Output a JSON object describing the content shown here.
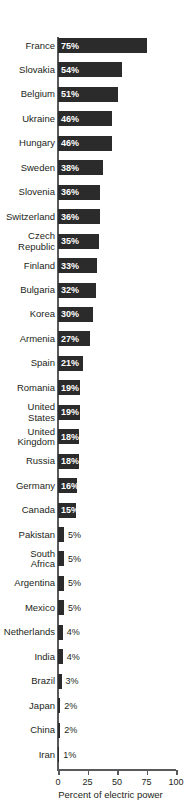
{
  "chart_data": {
    "type": "bar",
    "orientation": "horizontal",
    "title": "",
    "subtitle": "",
    "xlabel": "Percent of electric power",
    "ylabel": "",
    "xlim": [
      0,
      100
    ],
    "xticks": [
      0,
      25,
      50,
      75,
      100
    ],
    "xtick_labels": [
      "0",
      "25",
      "50",
      "75",
      "100"
    ],
    "grid": false,
    "legend": null,
    "value_suffix": "%",
    "bar_color": "#2b2b2b",
    "axis_color": "#58595b",
    "background_color": "#ffffff",
    "inside_label_color": "#ffffff",
    "outside_label_color": "#231f20",
    "inside_label_threshold": 15,
    "categories": [
      "France",
      "Slovakia",
      "Belgium",
      "Ukraine",
      "Hungary",
      "Sweden",
      "Slovenia",
      "Switzerland",
      "Czech\nRepublic",
      "Finland",
      "Bulgaria",
      "Korea",
      "Armenia",
      "Spain",
      "Romania",
      "United\nStates",
      "United\nKingdom",
      "Russia",
      "Germany",
      "Canada",
      "Pakistan",
      "South\nAfrica",
      "Argentina",
      "Mexico",
      "Netherlands",
      "India",
      "Brazil",
      "Japan",
      "China",
      "Iran"
    ],
    "values": [
      75,
      54,
      51,
      46,
      46,
      38,
      36,
      36,
      35,
      33,
      32,
      30,
      27,
      21,
      19,
      19,
      18,
      18,
      16,
      15,
      5,
      5,
      5,
      5,
      4,
      4,
      3,
      2,
      2,
      1
    ],
    "value_labels": [
      "75%",
      "54%",
      "51%",
      "46%",
      "46%",
      "38%",
      "36%",
      "36%",
      "35%",
      "33%",
      "32%",
      "30%",
      "27%",
      "21%",
      "19%",
      "19%",
      "18%",
      "18%",
      "16%",
      "15%",
      "5%",
      "5%",
      "5%",
      "5%",
      "4%",
      "4%",
      "3%",
      "2%",
      "2%",
      "1%"
    ]
  }
}
